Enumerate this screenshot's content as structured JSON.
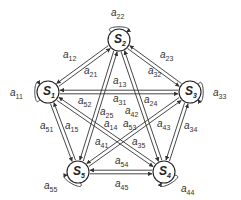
{
  "diagram": {
    "type": "fully-connected state transition graph",
    "nodes": [
      {
        "id": "S1",
        "label": "S",
        "sub": "1",
        "x": 48,
        "y": 92
      },
      {
        "id": "S2",
        "label": "S",
        "sub": "2",
        "x": 119,
        "y": 40
      },
      {
        "id": "S3",
        "label": "S",
        "sub": "3",
        "x": 190,
        "y": 92
      },
      {
        "id": "S4",
        "label": "S",
        "sub": "4",
        "x": 164,
        "y": 172
      },
      {
        "id": "S5",
        "label": "S",
        "sub": "5",
        "x": 78,
        "y": 172
      }
    ],
    "self_loops": [
      {
        "node": "S1",
        "label": "a",
        "sub": "11",
        "lx": 10,
        "ly": 96
      },
      {
        "node": "S2",
        "label": "a",
        "sub": "22",
        "lx": 111,
        "ly": 16
      },
      {
        "node": "S3",
        "label": "a",
        "sub": "33",
        "lx": 213,
        "ly": 96
      },
      {
        "node": "S4",
        "label": "a",
        "sub": "44",
        "lx": 181,
        "ly": 192
      },
      {
        "node": "S5",
        "label": "a",
        "sub": "55",
        "lx": 44,
        "ly": 189
      }
    ],
    "edges": [
      {
        "from": "S1",
        "to": "S2",
        "label": "a",
        "sub": "12",
        "lx": 63,
        "ly": 58
      },
      {
        "from": "S2",
        "to": "S1",
        "label": "a",
        "sub": "21",
        "lx": 84,
        "ly": 74
      },
      {
        "from": "S1",
        "to": "S3",
        "label": "a",
        "sub": "13",
        "lx": 113,
        "ly": 84
      },
      {
        "from": "S3",
        "to": "S1",
        "label": "a",
        "sub": "31",
        "lx": 113,
        "ly": 102
      },
      {
        "from": "S2",
        "to": "S3",
        "label": "a",
        "sub": "23",
        "lx": 160,
        "ly": 58
      },
      {
        "from": "S3",
        "to": "S2",
        "label": "a",
        "sub": "32",
        "lx": 148,
        "ly": 74
      },
      {
        "from": "S2",
        "to": "S4",
        "label": "a",
        "sub": "24",
        "lx": 144,
        "ly": 103
      },
      {
        "from": "S4",
        "to": "S2",
        "label": "a",
        "sub": "42",
        "lx": 125,
        "ly": 114
      },
      {
        "from": "S2",
        "to": "S5",
        "label": "a",
        "sub": "25",
        "lx": 100,
        "ly": 115
      },
      {
        "from": "S5",
        "to": "S2",
        "label": "a",
        "sub": "52",
        "lx": 78,
        "ly": 104
      },
      {
        "from": "S1",
        "to": "S4",
        "label": "a",
        "sub": "14",
        "lx": 104,
        "ly": 127
      },
      {
        "from": "S4",
        "to": "S1",
        "label": "a",
        "sub": "41",
        "lx": 95,
        "ly": 145
      },
      {
        "from": "S1",
        "to": "S5",
        "label": "a",
        "sub": "15",
        "lx": 65,
        "ly": 129
      },
      {
        "from": "S5",
        "to": "S1",
        "label": "a",
        "sub": "51",
        "lx": 40,
        "ly": 129
      },
      {
        "from": "S3",
        "to": "S5",
        "label": "a",
        "sub": "35",
        "lx": 132,
        "ly": 145
      },
      {
        "from": "S5",
        "to": "S3",
        "label": "a",
        "sub": "53",
        "lx": 123,
        "ly": 127
      },
      {
        "from": "S3",
        "to": "S4",
        "label": "a",
        "sub": "34",
        "lx": 184,
        "ly": 129
      },
      {
        "from": "S4",
        "to": "S3",
        "label": "a",
        "sub": "43",
        "lx": 157,
        "ly": 127
      },
      {
        "from": "S4",
        "to": "S5",
        "label": "a",
        "sub": "45",
        "lx": 115,
        "ly": 187
      },
      {
        "from": "S5",
        "to": "S4",
        "label": "a",
        "sub": "54",
        "lx": 115,
        "ly": 164
      }
    ],
    "colors": {
      "stroke": "#333333",
      "background": "#ffffff",
      "text": "#333333"
    }
  }
}
